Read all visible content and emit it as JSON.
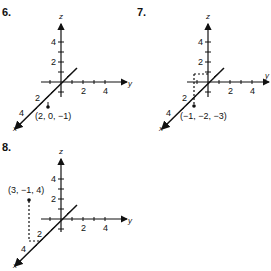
{
  "problems": [
    {
      "number": "6.",
      "axes": {
        "x": "x",
        "y": "y",
        "z": "z"
      },
      "ticks": {
        "z": [
          "2",
          "4"
        ],
        "y": [
          "2",
          "4"
        ],
        "x": [
          "2",
          "4"
        ]
      },
      "point_label": "(2, 0, −1)",
      "point": [
        2,
        0,
        -1
      ]
    },
    {
      "number": "7.",
      "axes": {
        "x": "x",
        "y": "y",
        "z": "z"
      },
      "ticks": {
        "z": [
          "2",
          "4"
        ],
        "y": [
          "2",
          "4"
        ],
        "x": [
          "2",
          "4"
        ]
      },
      "point_label": "(−1, −2, −3)",
      "point": [
        -1,
        -2,
        -3
      ]
    },
    {
      "number": "8.",
      "axes": {
        "x": "x",
        "y": "y",
        "z": "z"
      },
      "ticks": {
        "z": [
          "2",
          "4"
        ],
        "y": [
          "2",
          "4"
        ],
        "x": [
          "2",
          "4"
        ]
      },
      "point_label": "(3, −1, 4)",
      "point": [
        3,
        -1,
        4
      ]
    }
  ]
}
